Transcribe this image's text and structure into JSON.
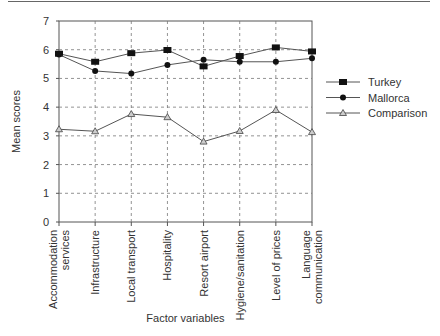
{
  "chart_data": {
    "type": "line",
    "title": "",
    "xlabel": "Factor variables",
    "ylabel": "Mean scores",
    "ylim": [
      0,
      7
    ],
    "yticks": [
      0,
      1,
      2,
      3,
      4,
      5,
      6,
      7
    ],
    "grid": true,
    "legend_position": "right",
    "categories": [
      [
        "Accommodation",
        "services"
      ],
      [
        "Infrastructure"
      ],
      [
        "Local transport"
      ],
      [
        "Hospitality"
      ],
      [
        "Resort airport"
      ],
      [
        "Hygiene/sanitation"
      ],
      [
        "Level of prices"
      ],
      [
        "Language",
        "communication"
      ]
    ],
    "series": [
      {
        "name": "Turkey",
        "marker": "square",
        "values": [
          5.86,
          5.58,
          5.88,
          5.99,
          5.42,
          5.78,
          6.08,
          5.94
        ]
      },
      {
        "name": "Mallorca",
        "marker": "circle",
        "values": [
          5.83,
          5.26,
          5.17,
          5.47,
          5.65,
          5.58,
          5.58,
          5.7
        ]
      },
      {
        "name": "Comparison",
        "marker": "triangle",
        "values": [
          3.23,
          3.16,
          3.76,
          3.65,
          2.8,
          3.17,
          3.9,
          3.13
        ]
      }
    ]
  },
  "colors": {
    "line": "#555555",
    "grid": "#777777",
    "axis": "#555555",
    "marker_fill": "#111111",
    "triangle_fill": "#cccccc"
  }
}
